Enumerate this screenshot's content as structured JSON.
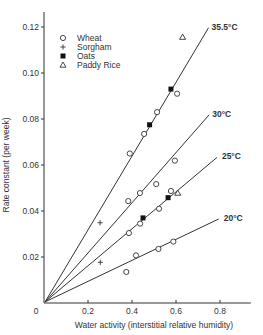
{
  "chart_data": {
    "type": "scatter",
    "title": "",
    "xlabel": "Water activity (interstitial relative humidity)",
    "ylabel": "Rate constant (per week)",
    "xlim": [
      0,
      0.94
    ],
    "ylim": [
      0,
      0.128
    ],
    "x_ticks": [
      0,
      0.2,
      0.4,
      0.6,
      0.8
    ],
    "x_tick_labels": [
      "0",
      "0.2",
      "0.4",
      "0.6",
      "0.8"
    ],
    "y_ticks": [
      0.02,
      0.04,
      0.06,
      0.08,
      0.1,
      0.12
    ],
    "y_tick_labels": [
      "0.02",
      "0.04",
      "0.06",
      "0.08",
      "0.10",
      "0.12"
    ],
    "grid": false,
    "legend_position": "upper-left",
    "legend": [
      {
        "name": "Wheat",
        "marker": "open-circle"
      },
      {
        "name": "Sorgham",
        "marker": "plus"
      },
      {
        "name": "Oats",
        "marker": "filled-square"
      },
      {
        "name": "Paddy Rice",
        "marker": "open-triangle"
      }
    ],
    "fit_lines": [
      {
        "label": "35.5°C",
        "slope": 0.16,
        "x_end": 0.748
      },
      {
        "label": "30°C",
        "slope": 0.109,
        "x_end": 0.751
      },
      {
        "label": "25°C",
        "slope": 0.0805,
        "x_end": 0.786
      },
      {
        "label": "20°C",
        "slope": 0.046,
        "x_end": 0.794
      }
    ],
    "series": [
      {
        "name": "Wheat",
        "marker": "open-circle",
        "points": [
          [
            0.39,
            0.065
          ],
          [
            0.455,
            0.0735
          ],
          [
            0.514,
            0.083
          ],
          [
            0.605,
            0.091
          ],
          [
            0.383,
            0.0443
          ],
          [
            0.436,
            0.0478
          ],
          [
            0.51,
            0.0517
          ],
          [
            0.595,
            0.0619
          ],
          [
            0.386,
            0.0304
          ],
          [
            0.437,
            0.0345
          ],
          [
            0.523,
            0.041
          ],
          [
            0.577,
            0.0487
          ],
          [
            0.374,
            0.0135
          ],
          [
            0.418,
            0.0207
          ],
          [
            0.52,
            0.0235
          ],
          [
            0.588,
            0.0267
          ]
        ]
      },
      {
        "name": "Sorgham",
        "marker": "plus",
        "points": [
          [
            0.255,
            0.0349
          ],
          [
            0.256,
            0.0177
          ]
        ]
      },
      {
        "name": "Oats",
        "marker": "filled-square",
        "points": [
          [
            0.48,
            0.0775
          ],
          [
            0.577,
            0.093
          ],
          [
            0.45,
            0.037
          ],
          [
            0.564,
            0.0458
          ]
        ]
      },
      {
        "name": "Paddy Rice",
        "marker": "open-triangle",
        "points": [
          [
            0.63,
            0.1156
          ],
          [
            0.608,
            0.0478
          ]
        ]
      }
    ]
  },
  "colors": {
    "axis": "#333333",
    "line": "#333333",
    "marker": "#333333",
    "background": "#ffffff"
  }
}
